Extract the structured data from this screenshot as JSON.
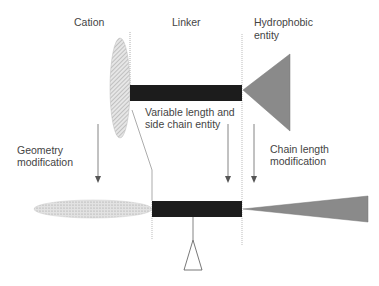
{
  "labels": {
    "cation": "Cation",
    "linker": "Linker",
    "hydrophobic_line1": "Hydrophobic",
    "hydrophobic_line2": "entity",
    "variable_line1": "Variable length and",
    "variable_line2": "side chain entity",
    "geometry_line1": "Geometry",
    "geometry_line2": "modification",
    "chain_line1": "Chain length",
    "chain_line2": "modification"
  },
  "colors": {
    "linker_bar": "#1c1c1c",
    "hydrophobic_triangle": "#8a8a8a",
    "cation_fill": "#d9d9d9",
    "text": "#444444",
    "lines": "#777777"
  }
}
